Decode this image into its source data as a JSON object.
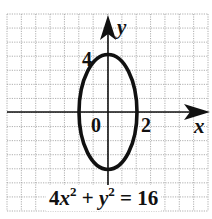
{
  "chart_data": {
    "type": "line",
    "title": "",
    "equation": "4x^2 + y^2 = 16",
    "curve": "ellipse",
    "center": [
      0,
      0
    ],
    "semi_axis_x": 2,
    "semi_axis_y": 4,
    "xlabel": "x",
    "ylabel": "y",
    "xlim": [
      -7,
      7
    ],
    "ylim": [
      -7,
      7
    ],
    "grid": true,
    "grid_step": 1,
    "annotations": [
      {
        "text": "4",
        "at": [
          0,
          4
        ]
      },
      {
        "text": "0",
        "at": [
          0,
          0
        ]
      },
      {
        "text": "2",
        "at": [
          2,
          0
        ]
      }
    ]
  },
  "axes": {
    "x_label": "x",
    "y_label": "y",
    "origin_label": "0",
    "x_tick_label": "2",
    "y_tick_label": "4"
  },
  "equation": {
    "coef": "4",
    "var1": "x",
    "exp1": "2",
    "plus": "+",
    "var2": "y",
    "exp2": "2",
    "equals": "=",
    "rhs": "16"
  },
  "colors": {
    "grid": "#9a9a9a",
    "axis": "#111111",
    "curve": "#111111",
    "background": "#ffffff"
  }
}
